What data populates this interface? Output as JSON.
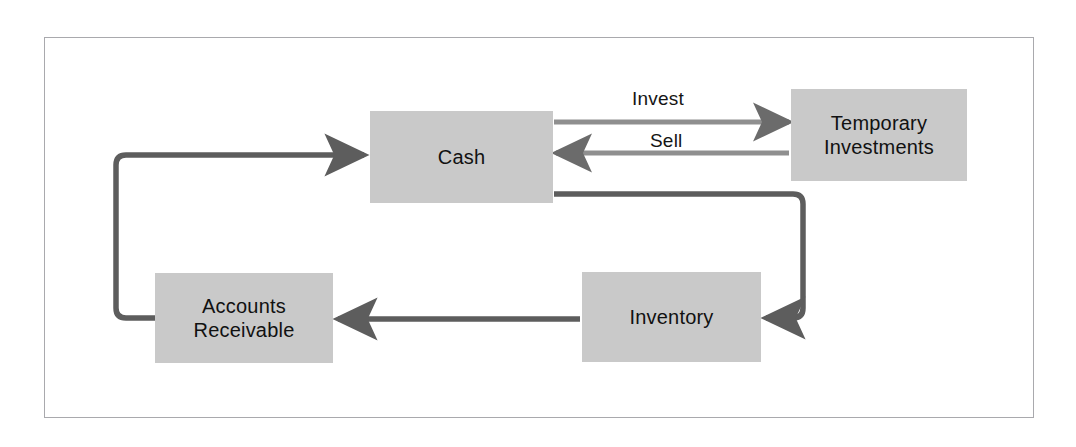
{
  "diagram": {
    "frame_color": "#a9a9ad",
    "node_fill": "#c9c9c9",
    "edge_color": "#6b6b6b",
    "nodes": [
      {
        "id": "cash",
        "label": "Cash"
      },
      {
        "id": "temp_inv",
        "label": "Temporary\nInvestments"
      },
      {
        "id": "ar",
        "label": "Accounts\nReceivable"
      },
      {
        "id": "inventory",
        "label": "Inventory"
      }
    ],
    "edges": [
      {
        "id": "invest",
        "from": "cash",
        "to": "temp_inv",
        "label": "Invest"
      },
      {
        "id": "sell",
        "from": "temp_inv",
        "to": "cash",
        "label": "Sell"
      },
      {
        "id": "cash_to_inv",
        "from": "cash",
        "to": "inventory",
        "label": ""
      },
      {
        "id": "inv_to_ar",
        "from": "inventory",
        "to": "ar",
        "label": ""
      },
      {
        "id": "ar_to_cash",
        "from": "ar",
        "to": "cash",
        "label": ""
      }
    ]
  }
}
